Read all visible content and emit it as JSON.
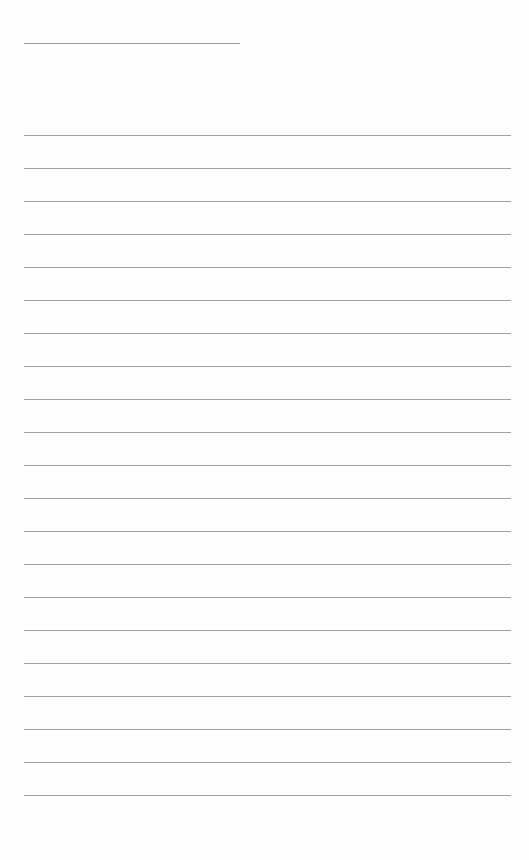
{
  "page": {
    "type": "blank lined notepad",
    "background_color": "#fefefe",
    "line_color": "#a2a2a2"
  },
  "title_line": {
    "x": 24,
    "y": 43,
    "width": 216
  },
  "ruled_lines": {
    "x": 24,
    "width": 487,
    "positions": [
      135,
      168,
      201,
      234,
      267,
      300,
      333,
      366,
      399,
      432,
      465,
      498,
      531,
      564,
      597,
      630,
      663,
      696,
      729,
      762,
      795
    ]
  }
}
